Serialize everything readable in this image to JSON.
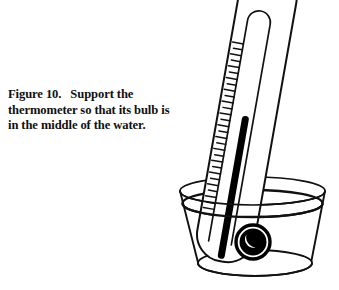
{
  "page": {
    "background_color": "#ffffff",
    "width": 339,
    "height": 290,
    "ink_color": "#111111"
  },
  "caption": {
    "figure_label": "Figure 10.",
    "line1_rest": "Support the",
    "line2": "thermometer so that its bulb",
    "line3": "is in the middle of the water.",
    "full_text": "Figure 10.   Support the thermometer so that its bulb is in the middle of the water."
  },
  "figure": {
    "thermometer": {
      "tilt_degrees": 10,
      "body_color": "#ffffff",
      "outline_color": "#111111",
      "mercury_color": "#000000",
      "tick_count": 30,
      "bulb": {
        "center_x": 253,
        "center_y": 242,
        "radius": 16,
        "fill": "#000000",
        "highlight": "#ffffff"
      }
    },
    "beaker": {
      "rim_left_x": 180,
      "rim_right_x": 325,
      "rim_y": 191,
      "water_line_y": 206,
      "base_y": 268,
      "fill": "none",
      "outline_color": "#111111"
    }
  }
}
